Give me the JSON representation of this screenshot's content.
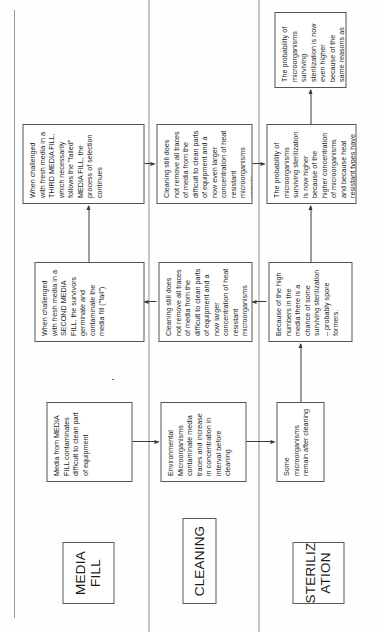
{
  "document": {
    "orientation": "landscape-rotated-ccw",
    "title_visible": false,
    "page_width": 385,
    "page_height": 632
  },
  "lanes": [
    {
      "id": "media-fill",
      "label": "MEDIA\nFILL"
    },
    {
      "id": "cleaning",
      "label": "CLEANING"
    },
    {
      "id": "sterilization",
      "label": "STERILIZ\nATION"
    }
  ],
  "nodes": {
    "mf1": "Media from MEDIA FILL contaminates difficult to clean part of equipment",
    "mf2": "When challenged with fresh media in a SECOND MEDIA FILL, the survivors germinate and contaminate the media fill (\"fail\")",
    "mf3": "When challenged with fresh media in a THIRD MEDIA FILL, which necessarily follows the \"failed\" MEDIA FILL, the process of selection continues",
    "cl1": "Environmental Microorganisms contaminate media traces and increase in concentration in interval before cleaning",
    "cl2": "Cleaning still does not remove all traces of media from the difficult to clean parts of equipment and a now larger concentration of heat resistant microorganisms remain",
    "cl3": "Cleaning still does not remove all traces of media from the difficult to clean parts of equipment and a now even larger concentration of heat resistant microorganisms remain",
    "st1": "Some microorganisms remain after cleaning",
    "st2": "Because of the high numbers in the media there is a chance of some surviving sterilization – probably spore formers.",
    "st3": "The probability of microorganisms surviving sterilization is now higher because of the higher concentration of microorganisms and because heat resistant types have been selected",
    "st4": "The probability of microorganisms surviving sterilization is now even higher because of the same reasons as before"
  },
  "colors": {
    "node_border": "#555555",
    "lane_border": "#5a5a5a",
    "connector": "#3b3b3b",
    "lane_line": "#8d8d8d",
    "page_rule": "#9a9a9a",
    "background": "#fefefe",
    "text": "#1c1c1c"
  }
}
